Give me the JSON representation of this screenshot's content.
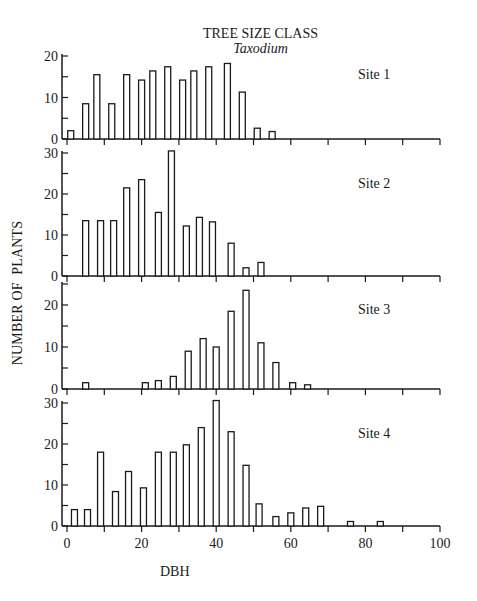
{
  "header": {
    "title": "TREE SIZE CLASS",
    "subtitle": "Taxodium"
  },
  "axes": {
    "ylabel": "NUMBER OF  PLANTS",
    "xlabel": "DBH"
  },
  "colors": {
    "ink": "#1a1a1a",
    "background": "#ffffff",
    "bar_fill": "#ffffff"
  },
  "chart_data": [
    {
      "type": "bar",
      "title": "Site 1",
      "xlabel": "DBH",
      "ylabel": "NUMBER OF PLANTS",
      "xlim": [
        0,
        100
      ],
      "ylim": [
        0,
        20
      ],
      "yticks": [
        0,
        10,
        20
      ],
      "x": [
        1,
        5,
        8,
        12,
        16,
        20,
        23,
        27,
        31,
        34,
        38,
        43,
        47,
        51,
        55
      ],
      "values": [
        2,
        8.5,
        15.5,
        8.5,
        15.5,
        14.2,
        16.4,
        17.4,
        14.2,
        16.4,
        17.4,
        18.2,
        11.3,
        2.6,
        1.8
      ]
    },
    {
      "type": "bar",
      "title": "Site 2",
      "xlabel": "DBH",
      "ylabel": "NUMBER OF PLANTS",
      "xlim": [
        0,
        100
      ],
      "ylim": [
        0,
        30
      ],
      "yticks": [
        0,
        10,
        20,
        30
      ],
      "x": [
        5,
        9,
        12.5,
        16,
        20,
        24.5,
        28,
        32,
        35.5,
        39,
        44,
        48,
        52
      ],
      "values": [
        13.5,
        13.5,
        13.5,
        21.5,
        23.5,
        15.5,
        30.5,
        12.2,
        14.3,
        13.2,
        8,
        2,
        3.3
      ]
    },
    {
      "type": "bar",
      "title": "Site 3",
      "xlabel": "DBH",
      "ylabel": "NUMBER OF PLANTS",
      "xlim": [
        0,
        100
      ],
      "ylim": [
        0,
        25
      ],
      "yticks": [
        0,
        10,
        20
      ],
      "x": [
        5,
        21,
        24.5,
        28.5,
        32.5,
        36.5,
        40,
        44,
        48,
        52,
        56,
        60.5,
        64.5
      ],
      "values": [
        1.5,
        1.5,
        2,
        3,
        9,
        12,
        10,
        18.5,
        23.5,
        11,
        6.3,
        1.5,
        1
      ]
    },
    {
      "type": "bar",
      "title": "Site 4",
      "xlabel": "DBH",
      "ylabel": "NUMBER OF PLANTS",
      "xlim": [
        0,
        100
      ],
      "ylim": [
        0,
        30
      ],
      "yticks": [
        0,
        10,
        20,
        30
      ],
      "xticks": [
        0,
        20,
        40,
        60,
        80,
        100
      ],
      "x": [
        2,
        5.5,
        9,
        13,
        16.5,
        20.5,
        24.5,
        28.5,
        32,
        36,
        40,
        44,
        48,
        51.5,
        56,
        60,
        64,
        68,
        76,
        84
      ],
      "values": [
        4,
        4,
        18,
        8.4,
        13.3,
        9.3,
        18,
        18,
        19.8,
        24,
        30.6,
        23,
        14.8,
        5.4,
        2.3,
        3.2,
        4.4,
        4.8,
        1.1,
        1.1
      ]
    }
  ],
  "layout": {
    "x0_px": 67,
    "x100_px": 440,
    "axis_x_px": 62,
    "panels": [
      {
        "zero_y": 139,
        "top_val": 20,
        "top_y": 56,
        "label_x": 358,
        "label_y": 76
      },
      {
        "zero_y": 276,
        "top_val": 30,
        "top_y": 153,
        "label_x": 358,
        "label_y": 188
      },
      {
        "zero_y": 389,
        "top_val": 20,
        "top_y": 305,
        "label_x": 358,
        "label_y": 314
      },
      {
        "zero_y": 526,
        "top_val": 30,
        "top_y": 403,
        "label_x": 358,
        "label_y": 437
      }
    ],
    "bar_width_px": 6
  }
}
